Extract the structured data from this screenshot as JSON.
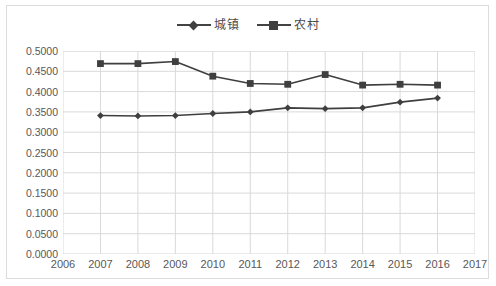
{
  "chart_data": {
    "type": "line",
    "title": "",
    "subtitle": "",
    "xlabel": "",
    "ylabel": "",
    "x": [
      2007,
      2008,
      2009,
      2010,
      2011,
      2012,
      2013,
      2014,
      2015,
      2016
    ],
    "xtick_labels": [
      "2006",
      "2007",
      "2008",
      "2009",
      "2010",
      "2011",
      "2012",
      "2013",
      "2014",
      "2015",
      "2016",
      "2017"
    ],
    "xlim": [
      2006,
      2017
    ],
    "ytick_labels": [
      "0.0000",
      "0.0500",
      "0.1000",
      "0.1500",
      "0.2000",
      "0.2500",
      "0.3000",
      "0.3500",
      "0.4000",
      "0.4500",
      "0.5000"
    ],
    "ytick_values": [
      0.0,
      0.05,
      0.1,
      0.15,
      0.2,
      0.25,
      0.3,
      0.35,
      0.4,
      0.45,
      0.5
    ],
    "ylim": [
      0.0,
      0.5
    ],
    "grid": true,
    "grid_axis": "both",
    "legend_position": "top-center",
    "series": [
      {
        "name": "城镇",
        "marker": "diamond",
        "color": "#3f3f3f",
        "values": [
          0.341,
          0.34,
          0.341,
          0.346,
          0.35,
          0.36,
          0.358,
          0.36,
          0.374,
          0.384
        ]
      },
      {
        "name": "农村",
        "marker": "square",
        "color": "#3f3f3f",
        "values": [
          0.469,
          0.469,
          0.474,
          0.438,
          0.42,
          0.418,
          0.442,
          0.416,
          0.418,
          0.416
        ]
      }
    ]
  },
  "style": {
    "line_color": "#3f3f3f",
    "grid_color": "#d9d9d9",
    "border_color": "#dcdcdc",
    "tick_text_color": "#585858",
    "plot_background": "#ffffff"
  }
}
